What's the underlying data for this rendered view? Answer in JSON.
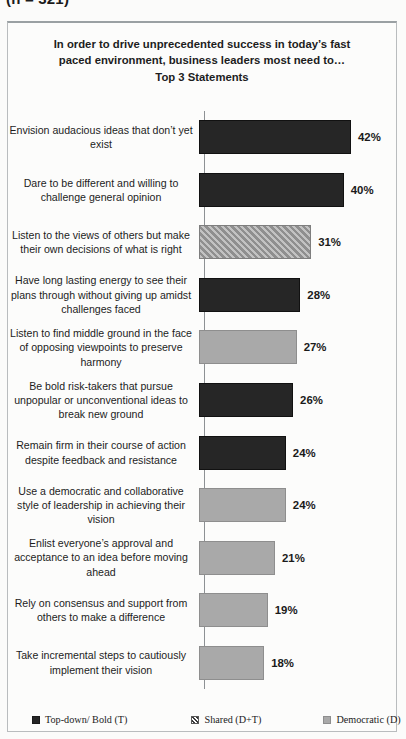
{
  "top_caption": "(n = 321)",
  "chart_frame": {
    "title_lines": [
      "In order to drive unprecedented success in today’s fast",
      "paced environment, business leaders most need to…",
      "Top 3 Statements"
    ]
  },
  "legend": {
    "items": [
      {
        "label": "Top-down/ Bold (T)",
        "style": "topdown",
        "color": "#262626"
      },
      {
        "label": "Shared (D+T)",
        "style": "shared",
        "color": "#8f8f8f"
      },
      {
        "label": "Democratic (D)",
        "style": "democratic",
        "color": "#a9a9a9"
      }
    ]
  },
  "chart_data": {
    "type": "bar",
    "orientation": "horizontal",
    "title": "In order to drive unprecedented success in today’s fast paced environment, business leaders most need to… Top 3 Statements",
    "xlabel": "",
    "ylabel": "",
    "xlim": [
      0,
      45
    ],
    "grid": false,
    "legend_position": "bottom",
    "value_suffix": "%",
    "categories": [
      "Envision audacious ideas that don’t yet exist",
      "Dare to be different and willing to challenge  general opinion",
      "Listen to the views of others but make their own decisions of what is right",
      "Have long lasting energy to see their plans through without giving up amidst challenges faced",
      "Listen to find middle ground in the face of opposing viewpoints  to preserve harmony",
      "Be bold risk-takers  that pursue unpopular or unconventional ideas to break new ground",
      "Remain firm in their course of action despite feedback and resistance",
      "Use a democratic and collaborative style of leadership  in achieving their vision",
      "Enlist everyone’s approval and acceptance to an idea before moving ahead",
      "Rely on consensus and support from others to make a difference",
      "Take incremental steps to cautiously implement their vision"
    ],
    "values": [
      42,
      40,
      31,
      28,
      27,
      26,
      24,
      24,
      21,
      19,
      18
    ],
    "value_labels": [
      "42%",
      "40%",
      "31%",
      "28%",
      "27%",
      "26%",
      "24%",
      "24%",
      "21%",
      "19%",
      "18%"
    ],
    "series_group": [
      "topdown",
      "topdown",
      "shared",
      "topdown",
      "democratic",
      "topdown",
      "topdown",
      "democratic",
      "democratic",
      "democratic",
      "democratic"
    ]
  }
}
